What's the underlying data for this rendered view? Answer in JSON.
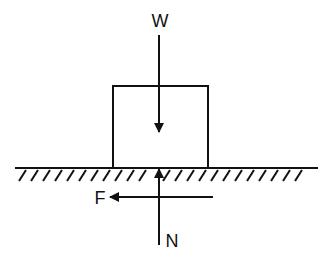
{
  "diagram": {
    "type": "free-body diagram",
    "colors": {
      "stroke": "#111111",
      "background": "#ffffff"
    },
    "labels": {
      "weight": "W",
      "friction": "F",
      "normal": "N"
    },
    "elements": {
      "block": "rectangular block resting on surface",
      "ground": "hatched horizontal surface",
      "forces": [
        {
          "label": "W",
          "direction": "down"
        },
        {
          "label": "F",
          "direction": "left"
        },
        {
          "label": "N",
          "direction": "up"
        }
      ]
    }
  }
}
